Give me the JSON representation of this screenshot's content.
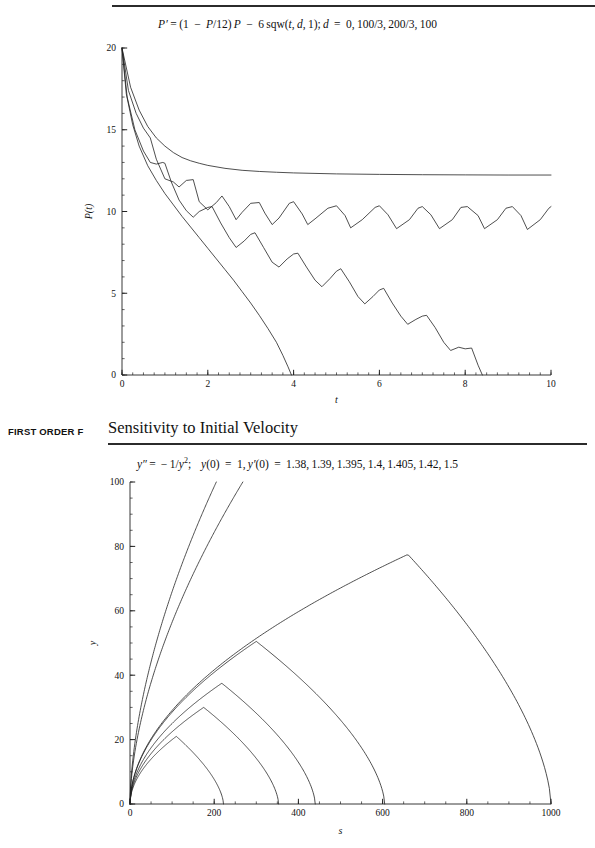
{
  "page": {
    "running_head": "FIRST ORDER F",
    "section_title": "Sensitivity to Initial Velocity",
    "top_rule_ghost": ""
  },
  "chart_data": [
    {
      "id": "logistic-harvest",
      "type": "line",
      "title": "P' = (1 − P/12)P − 6 sqw(t, d, 1); d = 0, 100/3, 200/3, 100",
      "equation_parts": {
        "lhs": "P′",
        "rhs": "(1 − P/12) P − 6 sqw(t, d, 1)",
        "params": "d = 0, 100/3, 200/3, 100"
      },
      "xlabel": "t",
      "ylabel": "P(t)",
      "xlim": [
        0,
        10
      ],
      "ylim": [
        0,
        20
      ],
      "xticks": [
        0,
        2,
        4,
        6,
        8,
        10
      ],
      "yticks": [
        0,
        5,
        10,
        15,
        20
      ],
      "xtick_labels": [
        "0",
        "2",
        "4",
        "6",
        "8",
        "10"
      ],
      "ytick_labels": [
        "0",
        "5",
        "10",
        "15",
        "20"
      ],
      "x_minor_step": 0.25,
      "y_minor_step": 1,
      "grid": false,
      "legend": "none",
      "series": [
        {
          "name": "d = 0",
          "duty": 0.0,
          "points": [
            [
              0,
              20
            ],
            [
              0.2,
              17.6
            ],
            [
              0.4,
              16.2
            ],
            [
              0.6,
              15.2
            ],
            [
              0.8,
              14.5
            ],
            [
              1.0,
              14.0
            ],
            [
              1.2,
              13.6
            ],
            [
              1.4,
              13.3
            ],
            [
              1.6,
              13.1
            ],
            [
              1.8,
              12.95
            ],
            [
              2.0,
              12.82
            ],
            [
              2.4,
              12.64
            ],
            [
              2.8,
              12.52
            ],
            [
              3.2,
              12.45
            ],
            [
              3.6,
              12.4
            ],
            [
              4.0,
              12.36
            ],
            [
              5.0,
              12.3
            ],
            [
              6.0,
              12.27
            ],
            [
              7.0,
              12.25
            ],
            [
              8.0,
              12.24
            ],
            [
              9.0,
              12.23
            ],
            [
              10,
              12.23
            ]
          ]
        },
        {
          "name": "d = 100/3",
          "duty": 0.3333,
          "points": [
            [
              0,
              20
            ],
            [
              0.15,
              17.4
            ],
            [
              0.33,
              16.0
            ],
            [
              0.5,
              15.1
            ],
            [
              0.66,
              14.5
            ],
            [
              0.8,
              13.2
            ],
            [
              1.0,
              12.0
            ],
            [
              1.2,
              11.8
            ],
            [
              1.33,
              11.5
            ],
            [
              1.5,
              11.9
            ],
            [
              1.66,
              11.95
            ],
            [
              1.8,
              10.6
            ],
            [
              2.0,
              10.1
            ],
            [
              2.2,
              10.55
            ],
            [
              2.33,
              10.95
            ],
            [
              2.5,
              10.3
            ],
            [
              2.66,
              9.5
            ],
            [
              2.8,
              9.95
            ],
            [
              3.0,
              10.5
            ],
            [
              3.2,
              10.55
            ],
            [
              3.33,
              9.9
            ],
            [
              3.5,
              9.2
            ],
            [
              3.66,
              9.6
            ],
            [
              3.9,
              10.5
            ],
            [
              4.0,
              10.6
            ],
            [
              4.2,
              9.85
            ],
            [
              4.33,
              9.2
            ],
            [
              4.5,
              9.55
            ],
            [
              4.8,
              10.2
            ],
            [
              5.0,
              10.35
            ],
            [
              5.2,
              9.75
            ],
            [
              5.33,
              9.0
            ],
            [
              5.6,
              9.5
            ],
            [
              5.9,
              10.25
            ],
            [
              6.0,
              10.35
            ],
            [
              6.2,
              9.8
            ],
            [
              6.4,
              8.95
            ],
            [
              6.7,
              9.5
            ],
            [
              6.9,
              10.2
            ],
            [
              7.0,
              10.3
            ],
            [
              7.2,
              9.8
            ],
            [
              7.4,
              8.95
            ],
            [
              7.7,
              9.5
            ],
            [
              7.9,
              10.25
            ],
            [
              8.05,
              10.3
            ],
            [
              8.3,
              9.75
            ],
            [
              8.45,
              8.95
            ],
            [
              8.75,
              9.5
            ],
            [
              8.95,
              10.2
            ],
            [
              9.1,
              10.3
            ],
            [
              9.3,
              9.75
            ],
            [
              9.45,
              8.9
            ],
            [
              9.75,
              9.5
            ],
            [
              9.95,
              10.2
            ],
            [
              10,
              10.3
            ]
          ]
        },
        {
          "name": "d = 200/3",
          "duty": 0.6667,
          "points": [
            [
              0,
              20
            ],
            [
              0.12,
              17.0
            ],
            [
              0.3,
              15.0
            ],
            [
              0.5,
              13.7
            ],
            [
              0.66,
              13.0
            ],
            [
              0.8,
              12.9
            ],
            [
              0.95,
              13.0
            ],
            [
              1.0,
              12.95
            ],
            [
              1.15,
              11.8
            ],
            [
              1.33,
              10.7
            ],
            [
              1.5,
              10.05
            ],
            [
              1.66,
              9.65
            ],
            [
              1.8,
              10.0
            ],
            [
              2.0,
              10.25
            ],
            [
              2.1,
              10.3
            ],
            [
              2.3,
              9.3
            ],
            [
              2.5,
              8.4
            ],
            [
              2.66,
              7.8
            ],
            [
              2.85,
              8.2
            ],
            [
              3.0,
              8.6
            ],
            [
              3.1,
              8.7
            ],
            [
              3.3,
              7.8
            ],
            [
              3.5,
              6.9
            ],
            [
              3.66,
              6.6
            ],
            [
              3.85,
              7.1
            ],
            [
              4.0,
              7.4
            ],
            [
              4.1,
              7.45
            ],
            [
              4.3,
              6.6
            ],
            [
              4.5,
              5.8
            ],
            [
              4.66,
              5.4
            ],
            [
              4.85,
              5.9
            ],
            [
              5.0,
              6.35
            ],
            [
              5.1,
              6.5
            ],
            [
              5.3,
              5.7
            ],
            [
              5.5,
              4.8
            ],
            [
              5.66,
              4.35
            ],
            [
              5.85,
              4.8
            ],
            [
              6.0,
              5.2
            ],
            [
              6.1,
              5.3
            ],
            [
              6.3,
              4.4
            ],
            [
              6.5,
              3.6
            ],
            [
              6.66,
              3.1
            ],
            [
              6.85,
              3.4
            ],
            [
              7.0,
              3.6
            ],
            [
              7.1,
              3.65
            ],
            [
              7.3,
              2.9
            ],
            [
              7.5,
              2.0
            ],
            [
              7.66,
              1.5
            ],
            [
              7.85,
              1.7
            ],
            [
              8.0,
              1.6
            ],
            [
              8.15,
              1.65
            ],
            [
              8.3,
              0.6
            ],
            [
              8.4,
              0
            ]
          ]
        },
        {
          "name": "d = 100",
          "duty": 1.0,
          "points": [
            [
              0,
              20
            ],
            [
              0.1,
              17.2
            ],
            [
              0.25,
              15.3
            ],
            [
              0.4,
              14.0
            ],
            [
              0.6,
              12.8
            ],
            [
              0.8,
              11.9
            ],
            [
              1.0,
              11.1
            ],
            [
              1.2,
              10.4
            ],
            [
              1.4,
              9.7
            ],
            [
              1.6,
              9.05
            ],
            [
              1.8,
              8.4
            ],
            [
              2.0,
              7.75
            ],
            [
              2.2,
              7.1
            ],
            [
              2.4,
              6.45
            ],
            [
              2.6,
              5.8
            ],
            [
              2.8,
              5.1
            ],
            [
              3.0,
              4.4
            ],
            [
              3.2,
              3.65
            ],
            [
              3.4,
              2.85
            ],
            [
              3.6,
              2.0
            ],
            [
              3.75,
              1.2
            ],
            [
              3.87,
              0.5
            ],
            [
              3.95,
              0
            ]
          ]
        }
      ]
    },
    {
      "id": "sensitivity-initial-velocity",
      "type": "line",
      "title": "y″ = −1/y²;   y(0) = 1, y′(0) = 1.38, 1.39, 1.395, 1.4, 1.405, 1.42, 1.5",
      "equation_parts": {
        "ode": "y″ = −1/y²",
        "initial_position": "y(0) = 1",
        "initial_velocities": [
          1.38,
          1.39,
          1.395,
          1.4,
          1.405,
          1.42,
          1.5
        ]
      },
      "xlabel": "s",
      "ylabel": "y",
      "xlim": [
        0,
        1000
      ],
      "ylim": [
        0,
        100
      ],
      "xticks": [
        0,
        200,
        400,
        600,
        800,
        1000
      ],
      "yticks": [
        0,
        20,
        40,
        60,
        80,
        100
      ],
      "xtick_labels": [
        "0",
        "200",
        "400",
        "600",
        "800",
        "1000"
      ],
      "ytick_labels": [
        "0",
        "20",
        "40",
        "60",
        "80",
        "100"
      ],
      "x_minor_step": 50,
      "y_minor_step": 5,
      "grid": false,
      "legend": "none",
      "series": [
        {
          "name": "y'(0) = 1.38",
          "apex": [
            110,
            21
          ],
          "landing": 222,
          "escape": false
        },
        {
          "name": "y'(0) = 1.39",
          "apex": [
            175,
            30
          ],
          "landing": 353,
          "escape": false
        },
        {
          "name": "y'(0) = 1.395",
          "apex": [
            218,
            37.5
          ],
          "landing": 440,
          "escape": false
        },
        {
          "name": "y'(0) = 1.4",
          "apex": [
            300,
            50.5
          ],
          "landing": 605,
          "escape": false
        },
        {
          "name": "y'(0) = 1.405",
          "apex": [
            660,
            77.5
          ],
          "landing": 1000,
          "escape": false
        },
        {
          "name": "y'(0) = 1.42",
          "apex": null,
          "landing": null,
          "escape": true,
          "exit_x": 268
        },
        {
          "name": "y'(0) = 1.5",
          "apex": null,
          "landing": null,
          "escape": true,
          "exit_x": 205
        }
      ]
    }
  ]
}
